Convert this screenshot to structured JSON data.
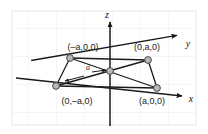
{
  "figure": {
    "background_color": "#ffffff",
    "grid_color": "#e8eaee",
    "line_color": "#1a1a1a",
    "node_fill": "#b8b8b8",
    "node_stroke": "#4a4a4a"
  },
  "axes": {
    "z_label": "z",
    "y_label": "y",
    "x_label": "x"
  },
  "points": [
    {
      "id": "upper-left",
      "label": "(–a,0,0)"
    },
    {
      "id": "upper-right",
      "label": "(0,a,0)"
    },
    {
      "id": "lower-left",
      "label": "(0,–a,0)"
    },
    {
      "id": "lower-right",
      "label": "(a,0,0)"
    },
    {
      "id": "origin",
      "label": ""
    }
  ],
  "dimension": {
    "label": "a"
  }
}
